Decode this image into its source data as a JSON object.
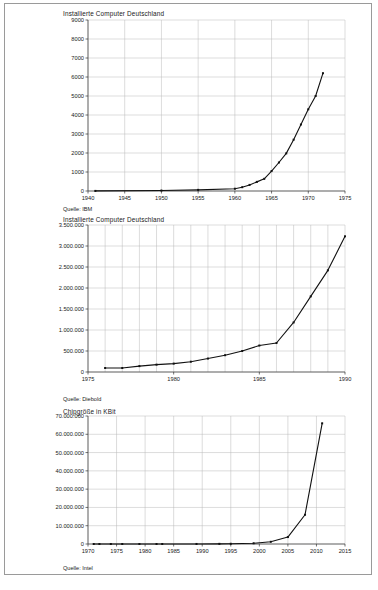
{
  "document": {
    "frame_border_color": "#9a9a9a",
    "background": "#ffffff"
  },
  "charts": [
    {
      "id": "installierte-computer-deutschland-ibm",
      "title": "Installierte Computer Deutschland",
      "source": "Quelle: IBM"
    },
    {
      "id": "installierte-computer-deutschland-diebold",
      "title": "Installierte Computer Deutschland",
      "source": "Quelle: Diebold"
    },
    {
      "id": "chipgroesse-in-kbit",
      "title": "Chipgröße in KBit",
      "source": "Quelle: Intel"
    }
  ],
  "chart_data": [
    {
      "type": "line",
      "title": "Installierte Computer Deutschland",
      "xlabel": "",
      "ylabel": "",
      "annotation": "Quelle: IBM",
      "grid": true,
      "legend": "none",
      "xlim": [
        1940,
        1975
      ],
      "ylim": [
        0,
        9000
      ],
      "xticks": [
        1940,
        1945,
        1950,
        1955,
        1960,
        1965,
        1970,
        1975
      ],
      "xticklabels": [
        "1940",
        "1945",
        "1950",
        "1955",
        "1960",
        "1965",
        "1970",
        "1975"
      ],
      "yticks": [
        0,
        1000,
        2000,
        3000,
        4000,
        5000,
        6000,
        7000,
        8000,
        9000
      ],
      "yticklabels": [
        "0",
        "1000",
        "2000",
        "3000",
        "4000",
        "5000",
        "6000",
        "7000",
        "8000",
        "9000"
      ],
      "x": [
        1941,
        1950,
        1955,
        1960,
        1961,
        1962,
        1963,
        1964,
        1965,
        1966,
        1967,
        1968,
        1969,
        1970,
        1971,
        1972
      ],
      "values": [
        5,
        25,
        60,
        120,
        200,
        320,
        480,
        640,
        1050,
        1500,
        1980,
        2700,
        3500,
        4300,
        5000,
        6200
      ]
    },
    {
      "type": "line",
      "title": "Installierte Computer Deutschland",
      "xlabel": "",
      "ylabel": "",
      "annotation": "Quelle: Diebold",
      "grid": true,
      "legend": "none",
      "xlim": [
        1975,
        1990
      ],
      "ylim": [
        0,
        3500000
      ],
      "xticks": [
        1975,
        1980,
        1985,
        1990
      ],
      "xticklabels": [
        "1975",
        "1980",
        "1985",
        "1990"
      ],
      "yticks": [
        0,
        500000,
        1000000,
        1500000,
        2000000,
        2500000,
        3000000,
        3500000
      ],
      "yticklabels": [
        "0",
        "500.000",
        "1.000.000",
        "1.500.000",
        "2.000.000",
        "2.500.000",
        "3.000.000",
        "3.500.000"
      ],
      "x": [
        1976,
        1977,
        1978,
        1979,
        1980,
        1981,
        1982,
        1983,
        1984,
        1985,
        1986,
        1987,
        1988,
        1989,
        1990
      ],
      "values": [
        95000,
        95000,
        140000,
        175000,
        200000,
        245000,
        320000,
        400000,
        500000,
        630000,
        690000,
        1180000,
        1800000,
        2420000,
        3230000
      ]
    },
    {
      "type": "line",
      "title": "Chipgröße in KBit",
      "xlabel": "",
      "ylabel": "",
      "annotation": "Quelle: Intel",
      "grid": true,
      "legend": "none",
      "xlim": [
        1970,
        2015
      ],
      "ylim": [
        0,
        70000000
      ],
      "xticks": [
        1970,
        1975,
        1980,
        1985,
        1990,
        1995,
        2000,
        2005,
        2010,
        2015
      ],
      "xticklabels": [
        "1970",
        "1975",
        "1980",
        "1985",
        "1990",
        "1995",
        "2000",
        "2005",
        "2010",
        "2015"
      ],
      "yticks": [
        0,
        10000000,
        20000000,
        30000000,
        40000000,
        50000000,
        60000000,
        70000000
      ],
      "yticklabels": [
        "0",
        "10.000.000",
        "20.000.000",
        "30.000.000",
        "40.000.000",
        "50.000.000",
        "60.000.000",
        "70.000.000"
      ],
      "x": [
        1971,
        1972,
        1974,
        1976,
        1979,
        1982,
        1983,
        1989,
        1993,
        1995,
        1999,
        2002,
        2005,
        2008,
        2011
      ],
      "values": [
        2,
        30,
        60,
        100,
        200,
        1000,
        1200,
        20000,
        80000,
        120000,
        400000,
        1200000,
        3800000,
        16000000,
        66000000
      ]
    }
  ]
}
